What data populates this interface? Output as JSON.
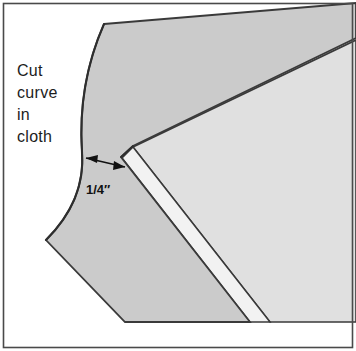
{
  "figure": {
    "title": "Cut curve in cloth",
    "frame": {
      "border_color": "#4a4a4a",
      "background_color": "#ffffff"
    },
    "annotations": {
      "instruction_lines": [
        "Cut",
        "curve",
        "in",
        "cloth"
      ],
      "instruction_full": "Cut curve in cloth",
      "dimension_label": "1/4″",
      "dimension_value": "1/4",
      "dimension_unit": "″"
    },
    "colors": {
      "cloth_fill": "#cbcbcb",
      "cloth_stroke": "#3a3a3a",
      "panel_fill": "#e0e0e0",
      "panel_stroke": "#3a3a3a",
      "fold_strip_fill": "#f2f2f2",
      "arrow_color": "#111111",
      "text_color": "#1c1c1c"
    },
    "shapes": [
      {
        "name": "cloth-piece",
        "description": "darker gray fabric with concave cut curve",
        "fill": "#cbcbcb"
      },
      {
        "name": "panel-top-face",
        "description": "lighter gray board face",
        "fill": "#e0e0e0"
      },
      {
        "name": "panel-fold-strip",
        "description": "narrow light strip along folded edge",
        "fill": "#f2f2f2"
      }
    ]
  }
}
